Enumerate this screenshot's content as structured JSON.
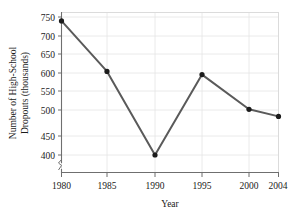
{
  "chart_data": {
    "type": "line",
    "title": "",
    "xlabel": "Year",
    "ylabel": "Number of High-School Dropouts (thousands)",
    "ylabel_line1": "Number of High-School",
    "ylabel_line2": "Dropouts (thousands)",
    "x": [
      1980,
      1985,
      1990,
      1995,
      2000,
      2004
    ],
    "categories": [
      "1980",
      "1985",
      "1990",
      "1995",
      "2000",
      "2004"
    ],
    "values": [
      740,
      612,
      400,
      604,
      516,
      498
    ],
    "series": [
      {
        "name": "High-School Dropouts",
        "values": [
          740,
          612,
          400,
          604,
          516,
          498
        ],
        "color": "#5a5a5a",
        "marker_color": "#1b1b1b"
      }
    ],
    "xlim": [
      1980,
      2004
    ],
    "ylim": [
      385,
      762
    ],
    "yticks": [
      400,
      450,
      500,
      550,
      600,
      650,
      700,
      750
    ],
    "ytick_labels": [
      "400",
      "450",
      "500",
      "550",
      "600",
      "650",
      "700",
      "750"
    ],
    "xticks": [
      1980,
      1985,
      1990,
      1995,
      2000,
      2004
    ],
    "xtick_labels": [
      "1980",
      "1985",
      "1990",
      "1995",
      "2000",
      "2004"
    ],
    "grid": true,
    "grid_axis": "y",
    "legend": false,
    "legend_position": "none",
    "y_axis_break": true,
    "axis_color": "#6f6f6f",
    "grid_color": "#e4e4e4",
    "background": "#ffffff"
  },
  "labels": {
    "ytick_0": "400",
    "ytick_1": "450",
    "ytick_2": "500",
    "ytick_3": "550",
    "ytick_4": "600",
    "ytick_5": "650",
    "ytick_6": "700",
    "ytick_7": "750",
    "xtick_0": "1980",
    "xtick_1": "1985",
    "xtick_2": "1990",
    "xtick_3": "1995",
    "xtick_4": "2000",
    "xtick_5": "2004",
    "xaxis_title": "Year",
    "yaxis_title_line1": "Number of High-School",
    "yaxis_title_line2": "Dropouts (thousands)"
  }
}
